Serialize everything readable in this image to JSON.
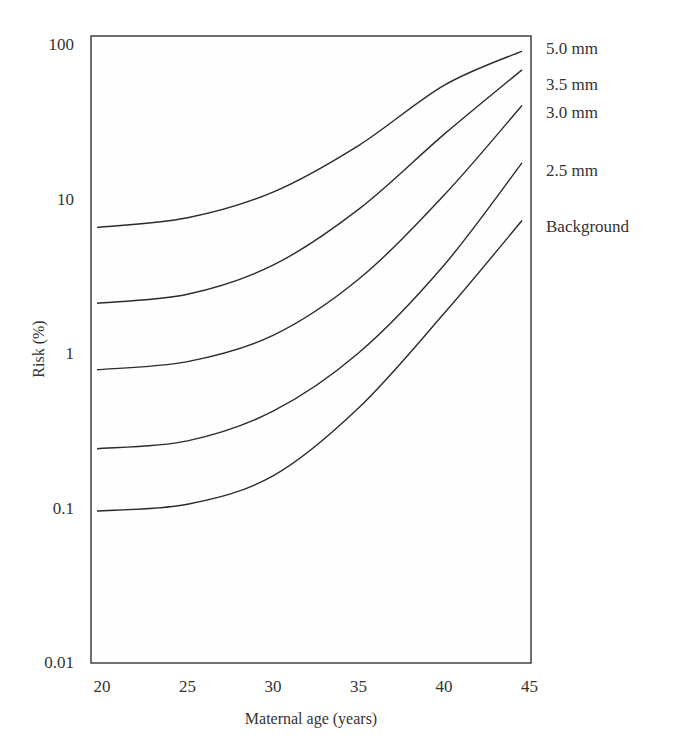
{
  "chart_data": {
    "type": "line",
    "title": "",
    "xlabel": "Maternal age (years)",
    "ylabel": "Risk (%)",
    "yscale": "log",
    "xlim": [
      20,
      45
    ],
    "ylim": [
      0.01,
      100
    ],
    "xticks": [
      20,
      25,
      30,
      35,
      40,
      45
    ],
    "yticks": [
      0.01,
      0.1,
      1,
      10,
      100
    ],
    "ytick_labels": [
      "0.01",
      "0.1",
      "1",
      "10",
      "100"
    ],
    "grid": false,
    "legend_position": "right, inline labels at curve ends",
    "x": [
      20,
      25,
      30,
      35,
      40,
      45
    ],
    "series": [
      {
        "name": "5.0 mm",
        "values": [
          6.5,
          7.5,
          11,
          22,
          54,
          90
        ]
      },
      {
        "name": "3.5 mm",
        "values": [
          2.1,
          2.4,
          3.7,
          8.5,
          26,
          68
        ]
      },
      {
        "name": "3.0 mm",
        "values": [
          0.78,
          0.88,
          1.3,
          3.0,
          10.5,
          40
        ]
      },
      {
        "name": "2.5 mm",
        "values": [
          0.24,
          0.27,
          0.42,
          1.0,
          3.7,
          17
        ]
      },
      {
        "name": "Background",
        "values": [
          0.095,
          0.105,
          0.16,
          0.44,
          1.8,
          7.2
        ]
      }
    ]
  }
}
